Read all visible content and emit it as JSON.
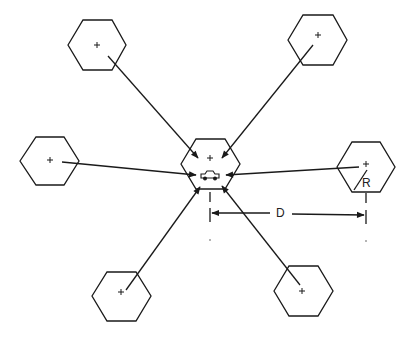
{
  "diagram": {
    "title": "",
    "center_cell": {
      "cx": 210,
      "cy": 165,
      "marker": "+",
      "icon": "vehicle-icon"
    },
    "cells": [
      {
        "id": "top-left",
        "cx": 97,
        "cy": 45,
        "marker": "+"
      },
      {
        "id": "top-right",
        "cx": 318,
        "cy": 40,
        "marker": "+"
      },
      {
        "id": "left",
        "cx": 50,
        "cy": 161,
        "marker": "+"
      },
      {
        "id": "right",
        "cx": 366,
        "cy": 167,
        "marker": "+"
      },
      {
        "id": "bottom-left",
        "cx": 121,
        "cy": 294,
        "marker": "+"
      },
      {
        "id": "bottom-right",
        "cx": 302,
        "cy": 291,
        "marker": "+"
      }
    ],
    "labels": {
      "distance": "D",
      "radius": "R"
    },
    "colors": {
      "stroke": "#1a1a1a",
      "background": "#ffffff"
    }
  }
}
